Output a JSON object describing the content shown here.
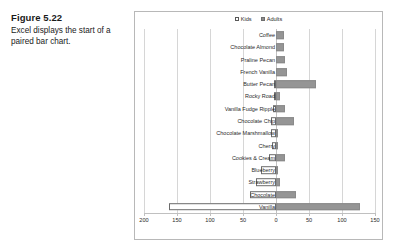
{
  "caption": {
    "figure_number": "Figure 5.22",
    "description": "Excel displays the start of a paired bar chart."
  },
  "chart_data": {
    "type": "bar",
    "orientation": "horizontal",
    "style": "paired/tornado bar chart",
    "title": "",
    "xlabel": "",
    "ylabel": "",
    "legend": [
      {
        "name": "Kids",
        "color": "#ffffff",
        "border": "#6b6b6b"
      },
      {
        "name": "Adults",
        "color": "#959595",
        "border": "#8a8a8a"
      }
    ],
    "legend_position": "top-center",
    "grid": true,
    "axis": {
      "tick_labels": [
        "200",
        "150",
        "100",
        "50",
        "0",
        "50",
        "100",
        "150"
      ],
      "tick_values": [
        -200,
        -150,
        -100,
        -50,
        0,
        50,
        100,
        150
      ],
      "xlim": [
        -200,
        150
      ],
      "note": "left side (Kids) values shown as positive magnitudes"
    },
    "categories": [
      "Coffee",
      "Chocolate Almond",
      "Praline Pecan",
      "French Vanilla",
      "Butter Pecan",
      "Rocky Road",
      "Vanilla Fudge Ripple",
      "Chocolate Chip",
      "Chocolate Marshmallow",
      "Cherry",
      "Cookies & Cream",
      "Blueberry",
      "Strawberry",
      "Chocolate",
      "Vanilla"
    ],
    "series": [
      {
        "name": "Kids",
        "values": [
          0,
          0,
          0,
          0,
          2,
          3,
          4,
          8,
          8,
          6,
          10,
          22,
          30,
          39,
          162
        ]
      },
      {
        "name": "Adults",
        "values": [
          12,
          12,
          13,
          16,
          60,
          6,
          14,
          28,
          2,
          3,
          14,
          1,
          6,
          30,
          128
        ]
      }
    ]
  }
}
